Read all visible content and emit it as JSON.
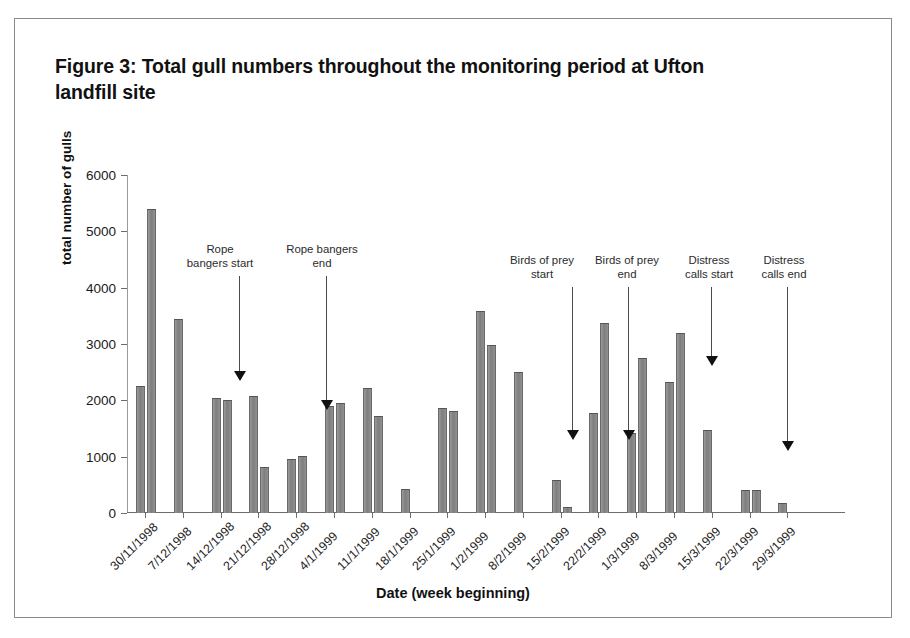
{
  "figure": {
    "title": "Figure 3: Total gull numbers throughout the monitoring period at Ufton landfill site"
  },
  "chart_data": {
    "type": "bar",
    "title": "Figure 3: Total gull numbers throughout the monitoring period at Ufton landfill site",
    "xlabel": "Date (week beginning)",
    "ylabel": "total number of gulls",
    "ylim": [
      0,
      6000
    ],
    "ytick_labels": [
      "6000",
      "5000",
      "4000",
      "3000",
      "2000",
      "1000",
      "0"
    ],
    "ytick_values": [
      6000,
      5000,
      4000,
      3000,
      2000,
      1000,
      0
    ],
    "grid": false,
    "legend": "none",
    "categories": [
      "30/11/1998",
      "7/12/1998",
      "14/12/1998",
      "21/12/1998",
      "28/12/1998",
      "4/1/1999",
      "11/1/1999",
      "18/1/1999",
      "25/1/1999",
      "1/2/1999",
      "8/2/1999",
      "15/2/1999",
      "22/2/1999",
      "1/3/1999",
      "8/3/1999",
      "15/3/1999",
      "22/3/1999",
      "29/3/1999"
    ],
    "bars": [
      {
        "category": "30/11/1998",
        "slot": 0,
        "value": 2250
      },
      {
        "category": "30/11/1998",
        "slot": 1,
        "value": 5400
      },
      {
        "category": "7/12/1998",
        "slot": 0,
        "value": 3450
      },
      {
        "category": "14/12/1998",
        "slot": 0,
        "value": 2050
      },
      {
        "category": "14/12/1998",
        "slot": 1,
        "value": 2000
      },
      {
        "category": "21/12/1998",
        "slot": 0,
        "value": 2080
      },
      {
        "category": "21/12/1998",
        "slot": 1,
        "value": 820
      },
      {
        "category": "28/12/1998",
        "slot": 0,
        "value": 960
      },
      {
        "category": "28/12/1998",
        "slot": 1,
        "value": 1010
      },
      {
        "category": "4/1/1999",
        "slot": 0,
        "value": 1900
      },
      {
        "category": "4/1/1999",
        "slot": 1,
        "value": 1950
      },
      {
        "category": "11/1/1999",
        "slot": 0,
        "value": 2220
      },
      {
        "category": "11/1/1999",
        "slot": 1,
        "value": 1720
      },
      {
        "category": "18/1/1999",
        "slot": 0,
        "value": 420
      },
      {
        "category": "25/1/1999",
        "slot": 0,
        "value": 1860
      },
      {
        "category": "25/1/1999",
        "slot": 1,
        "value": 1810
      },
      {
        "category": "1/2/1999",
        "slot": 0,
        "value": 3590
      },
      {
        "category": "1/2/1999",
        "slot": 1,
        "value": 2990
      },
      {
        "category": "8/2/1999",
        "slot": 0,
        "value": 2500
      },
      {
        "category": "15/2/1999",
        "slot": 0,
        "value": 580
      },
      {
        "category": "15/2/1999",
        "slot": 1,
        "value": 100
      },
      {
        "category": "22/2/1999",
        "slot": 0,
        "value": 1780
      },
      {
        "category": "22/2/1999",
        "slot": 1,
        "value": 3380
      },
      {
        "category": "1/3/1999",
        "slot": 0,
        "value": 1420
      },
      {
        "category": "1/3/1999",
        "slot": 1,
        "value": 2760
      },
      {
        "category": "8/3/1999",
        "slot": 0,
        "value": 2320
      },
      {
        "category": "8/3/1999",
        "slot": 1,
        "value": 3200
      },
      {
        "category": "15/3/1999",
        "slot": 0,
        "value": 1480
      },
      {
        "category": "22/3/1999",
        "slot": 0,
        "value": 400
      },
      {
        "category": "22/3/1999",
        "slot": 1,
        "value": 410
      },
      {
        "category": "29/3/1999",
        "slot": 0,
        "value": 180
      }
    ],
    "annotations": [
      {
        "id": "rope-bangers-start",
        "text": "Rope\nbangers start",
        "label_x": 205,
        "label_y": 224,
        "arrow_x": 224,
        "arrow_top": 257,
        "arrow_bottom": 352
      },
      {
        "id": "rope-bangers-end",
        "text": "Rope bangers\nend",
        "label_x": 307,
        "label_y": 224,
        "arrow_x": 311,
        "arrow_top": 257,
        "arrow_bottom": 381
      },
      {
        "id": "birds-of-prey-start",
        "text": "Birds of prey\nstart",
        "label_x": 527,
        "label_y": 235,
        "arrow_x": 557,
        "arrow_top": 268,
        "arrow_bottom": 411
      },
      {
        "id": "birds-of-prey-end",
        "text": "Birds of prey\nend",
        "label_x": 612,
        "label_y": 235,
        "arrow_x": 613,
        "arrow_top": 268,
        "arrow_bottom": 411
      },
      {
        "id": "distress-calls-start",
        "text": "Distress\ncalls start",
        "label_x": 694,
        "label_y": 235,
        "arrow_x": 696,
        "arrow_top": 268,
        "arrow_bottom": 337
      },
      {
        "id": "distress-calls-end",
        "text": "Distress\ncalls end",
        "label_x": 769,
        "label_y": 235,
        "arrow_x": 772,
        "arrow_top": 268,
        "arrow_bottom": 422
      }
    ],
    "colors": {
      "bar_fill": "#8c8c8c",
      "bar_edge": "#555555",
      "axis": "#6d6d6d",
      "text": "#111111",
      "frame": "#8a8a8a"
    }
  }
}
